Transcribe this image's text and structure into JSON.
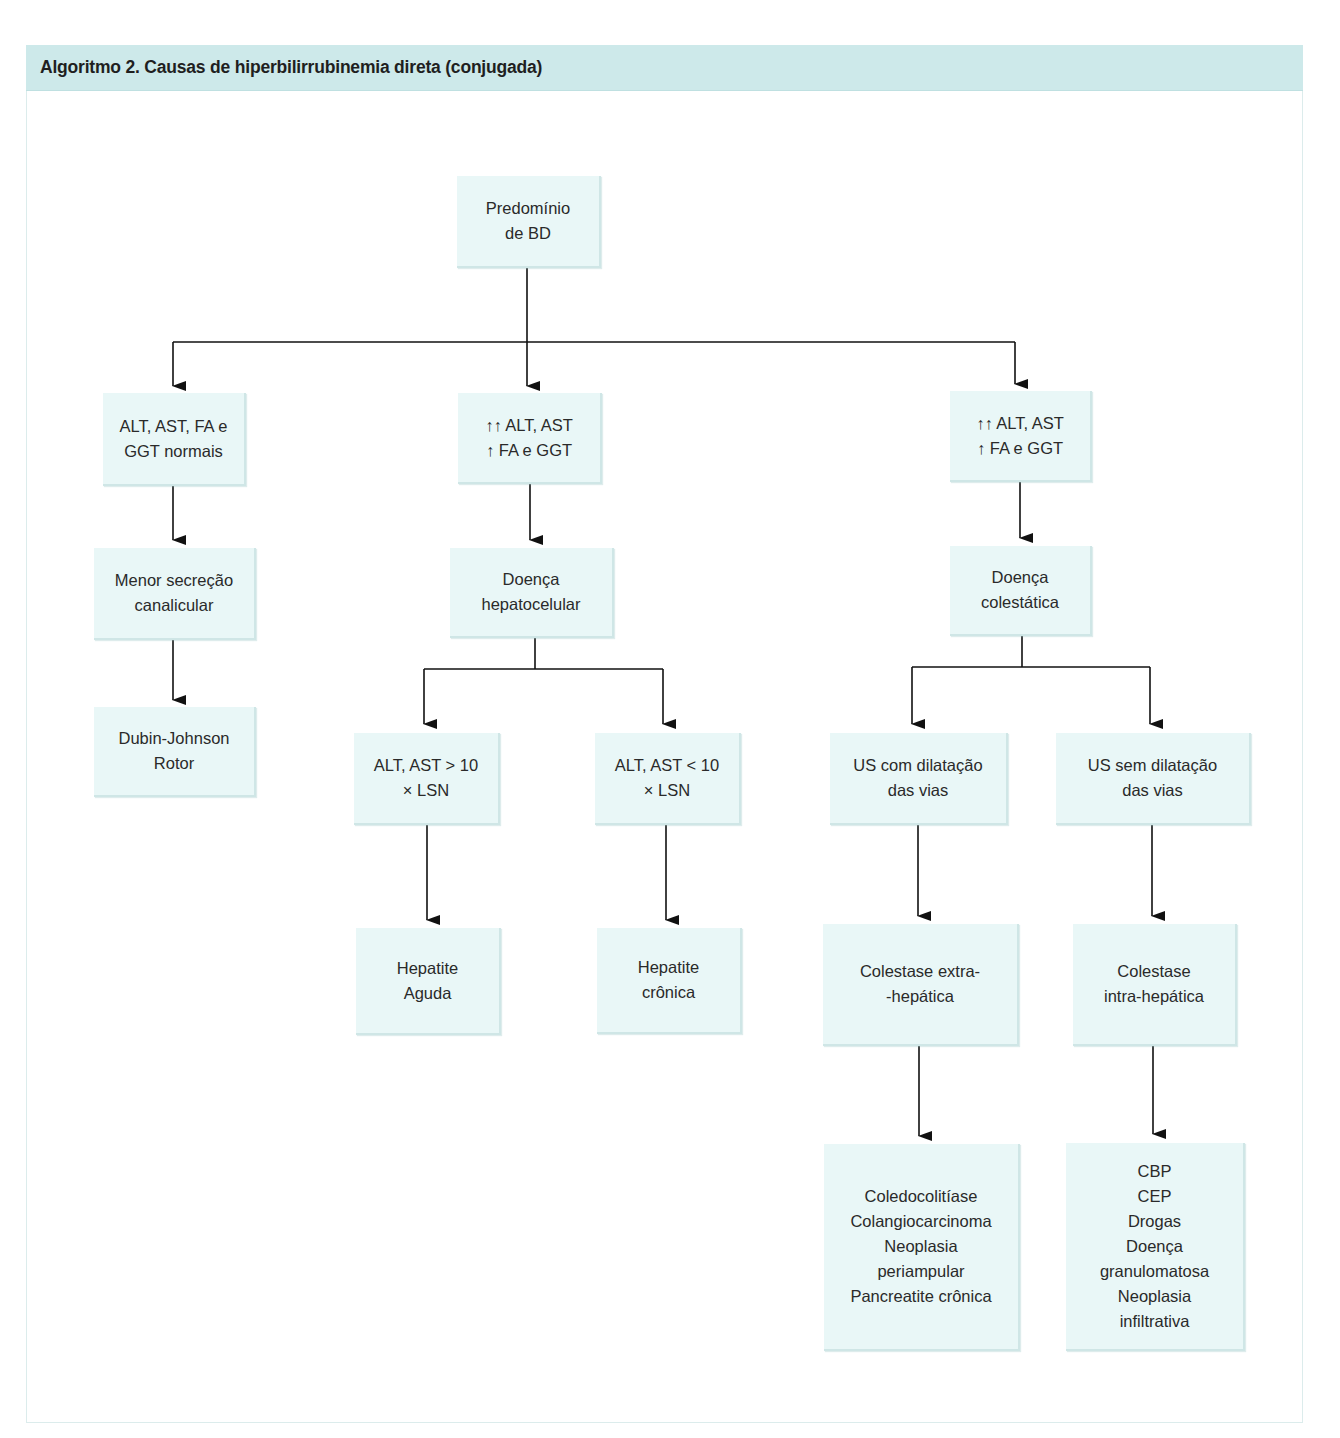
{
  "header": {
    "title": "Algoritmo 2. Causas de hiperbilirrubinemia direta (conjugada)",
    "background_color": "#cde9ea"
  },
  "colors": {
    "node_fill": "#e9f7f7",
    "node_edge": "#cfe6e6",
    "line": "#111111",
    "text": "#2a2a2a"
  },
  "nodes": {
    "root": {
      "lines": [
        "Predomínio",
        "de BD"
      ]
    },
    "left_tests": {
      "lines": [
        "ALT, AST, FA e",
        "GGT normais"
      ]
    },
    "mid_tests": {
      "lines": [
        "↑↑ ALT, AST",
        "↑ FA e GGT"
      ]
    },
    "right_tests": {
      "lines": [
        "↑↑ ALT, AST",
        "↑ FA e GGT"
      ]
    },
    "left_mech": {
      "lines": [
        "Menor secreção",
        "canalicular"
      ]
    },
    "mid_disease": {
      "lines": [
        "Doença",
        "hepatocelular"
      ]
    },
    "right_disease": {
      "lines": [
        "Doença",
        "colestática"
      ]
    },
    "left_result": {
      "lines": [
        "Dubin-Johnson",
        "Rotor"
      ]
    },
    "alt_high": {
      "lines": [
        "ALT, AST > 10",
        "× LSN"
      ]
    },
    "alt_low": {
      "lines": [
        "ALT, AST < 10",
        "× LSN"
      ]
    },
    "us_dilated": {
      "lines": [
        "US com dilatação",
        "das vias"
      ]
    },
    "us_not_dilated": {
      "lines": [
        "US sem dilatação",
        "das vias"
      ]
    },
    "acute_hepatitis": {
      "lines": [
        "Hepatite",
        "Aguda"
      ]
    },
    "chronic_hepatitis": {
      "lines": [
        "Hepatite",
        "crônica"
      ]
    },
    "extra_hepatic": {
      "lines": [
        "Colestase extra-",
        "-hepática"
      ]
    },
    "intra_hepatic": {
      "lines": [
        "Colestase",
        "intra-hepática"
      ]
    },
    "extra_causes": {
      "lines": [
        "Coledocolitíase",
        "Colangiocarcinoma",
        "Neoplasia",
        "periampular",
        "Pancreatite crônica"
      ]
    },
    "intra_causes": {
      "lines": [
        "CBP",
        "CEP",
        "Drogas",
        "Doença",
        "granulomatosa",
        "Neoplasia",
        "infiltrativa"
      ]
    }
  },
  "edges": [
    [
      "root",
      "left_tests"
    ],
    [
      "root",
      "mid_tests"
    ],
    [
      "root",
      "right_tests"
    ],
    [
      "left_tests",
      "left_mech"
    ],
    [
      "left_mech",
      "left_result"
    ],
    [
      "mid_tests",
      "mid_disease"
    ],
    [
      "mid_disease",
      "alt_high"
    ],
    [
      "mid_disease",
      "alt_low"
    ],
    [
      "alt_high",
      "acute_hepatitis"
    ],
    [
      "alt_low",
      "chronic_hepatitis"
    ],
    [
      "right_tests",
      "right_disease"
    ],
    [
      "right_disease",
      "us_dilated"
    ],
    [
      "right_disease",
      "us_not_dilated"
    ],
    [
      "us_dilated",
      "extra_hepatic"
    ],
    [
      "us_not_dilated",
      "intra_hepatic"
    ],
    [
      "extra_hepatic",
      "extra_causes"
    ],
    [
      "intra_hepatic",
      "intra_causes"
    ]
  ]
}
